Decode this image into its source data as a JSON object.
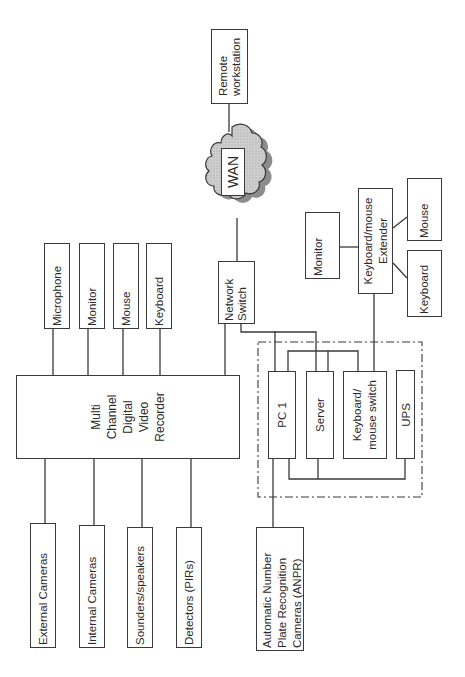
{
  "diagram": {
    "type": "block-diagram",
    "orientation": "rotated-90-ccw",
    "wan": {
      "label": "WAN"
    },
    "remote_workstation": {
      "label": "Remote\nworkstation",
      "line1": "Remote",
      "line2": "workstation"
    },
    "dvr": {
      "line1": "Multi",
      "line2": "Channel",
      "line3": "Digital",
      "line4": "Video",
      "line5": "Recorder"
    },
    "dvr_outputs": [
      {
        "label": "Microphone"
      },
      {
        "label": "Monitor"
      },
      {
        "label": "Mouse"
      },
      {
        "label": "Keyboard"
      }
    ],
    "dvr_inputs": [
      {
        "label": "External Cameras"
      },
      {
        "label": "Internal Cameras"
      },
      {
        "label": "Sounders/speakers"
      },
      {
        "label": "Detectors (PIRs)"
      }
    ],
    "network_switch": {
      "line1": "Network",
      "line2": "Switch"
    },
    "rack": {
      "pc1": {
        "label": "PC 1"
      },
      "server": {
        "label": "Server"
      },
      "kvm_switch": {
        "line1": "Keyboard/",
        "line2": "mouse switch"
      },
      "ups": {
        "label": "UPS"
      }
    },
    "anpr": {
      "line1": "Automatic Number",
      "line2": "Plate Recognition",
      "line3": "Cameras (ANPR)"
    },
    "extender": {
      "line1": "Keyboard/mouse",
      "line2": "Extender",
      "monitor": {
        "label": "Monitor"
      },
      "mouse": {
        "label": "Mouse"
      },
      "keyboard": {
        "label": "Keyboard"
      }
    }
  }
}
